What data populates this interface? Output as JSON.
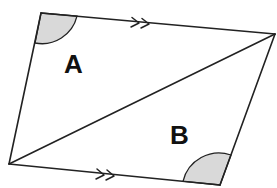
{
  "diagram": {
    "type": "parallelogram-with-diagonal",
    "vertices": {
      "top_left": [
        41,
        13
      ],
      "top_right": [
        275,
        34
      ],
      "bottom_right": [
        220,
        185
      ],
      "bottom_left": [
        9,
        164
      ]
    },
    "diagonal": {
      "from": "bottom_left",
      "to": "top_right"
    },
    "parallel_marks": {
      "count": 2,
      "edges": [
        "top",
        "bottom"
      ],
      "glyph": "double-arrowhead"
    },
    "shaded_angles": [
      {
        "vertex": "top_left",
        "color": "#d9d9d9"
      },
      {
        "vertex": "bottom_right",
        "color": "#d9d9d9"
      }
    ],
    "labels": {
      "region_a": "A",
      "region_b": "B"
    },
    "colors": {
      "line": "#222222",
      "shade": "#d9d9d9",
      "background": "#ffffff"
    }
  }
}
